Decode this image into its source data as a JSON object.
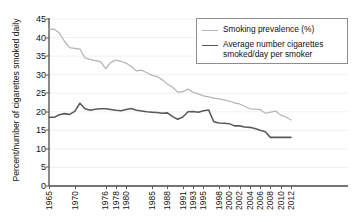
{
  "figure": {
    "cut_off_header": "",
    "background": "#ffffff"
  },
  "axes": {
    "ylabel": "Percent/number of cigarettes smoked daily",
    "xlabel": "",
    "yticks": [
      "0",
      "5",
      "10",
      "15",
      "20",
      "25",
      "30",
      "35",
      "40",
      "45"
    ],
    "xticks": [
      "1965",
      "1970",
      "1976",
      "1978",
      "1980",
      "1985",
      "1988",
      "1991",
      "1993",
      "1995",
      "1998",
      "2000",
      "2002",
      "2004",
      "2006",
      "2008",
      "2010",
      "2012"
    ]
  },
  "legend": {
    "position": "top-right",
    "items": [
      {
        "label": "Smoking prevalence (%)",
        "color": "#b5b5b5",
        "weight": "thin"
      },
      {
        "label": "Average number cigarettes\nsmoked/day per smoker",
        "color": "#5a5a5a",
        "weight": "thick"
      }
    ]
  },
  "colors": {
    "prevalence": "#b5b5b5",
    "cigarettes": "#5a5a5a",
    "axis": "#4a4a4a",
    "grid": "#f0f0f0",
    "legend_border": "#8e8e8e"
  },
  "chart_data": {
    "type": "line",
    "title": "",
    "xlabel": "",
    "ylabel": "Percent/number of cigarettes smoked daily",
    "ylim": [
      0,
      45
    ],
    "xlim": [
      1965,
      2012
    ],
    "ytick_step": 5,
    "grid": true,
    "legend_position": "top-right",
    "x": [
      1965,
      1966,
      1967,
      1968,
      1969,
      1970,
      1971,
      1972,
      1973,
      1974,
      1975,
      1976,
      1977,
      1978,
      1979,
      1980,
      1981,
      1982,
      1983,
      1984,
      1985,
      1986,
      1987,
      1988,
      1989,
      1990,
      1991,
      1992,
      1993,
      1994,
      1995,
      1996,
      1997,
      1998,
      1999,
      2000,
      2001,
      2002,
      2003,
      2004,
      2005,
      2006,
      2007,
      2008,
      2009,
      2010,
      2011,
      2012
    ],
    "series": [
      {
        "name": "Smoking prevalence (%)",
        "color": "#b5b5b5",
        "unit": "percent",
        "values": [
          42.2,
          42.3,
          41.2,
          39.0,
          37.3,
          37.1,
          36.9,
          34.5,
          34.1,
          33.8,
          33.5,
          31.6,
          33.3,
          33.9,
          33.6,
          33.1,
          32.2,
          31.0,
          31.2,
          30.5,
          29.8,
          29.5,
          28.6,
          27.5,
          26.6,
          25.3,
          25.4,
          26.1,
          25.2,
          24.8,
          24.3,
          24.0,
          23.7,
          23.5,
          23.2,
          22.9,
          22.4,
          22.1,
          21.5,
          20.8,
          20.7,
          20.6,
          19.6,
          19.9,
          20.2,
          19.1,
          18.6,
          17.8
        ]
      },
      {
        "name": "Average number cigarettes smoked/day per smoker",
        "color": "#5a5a5a",
        "unit": "cigarettes per day",
        "values": [
          18.5,
          18.5,
          19.2,
          19.5,
          19.3,
          20.1,
          22.3,
          20.8,
          20.4,
          20.7,
          20.8,
          20.8,
          20.6,
          20.4,
          20.3,
          20.6,
          20.9,
          20.4,
          20.2,
          20.0,
          19.9,
          19.8,
          19.6,
          19.7,
          18.7,
          18.0,
          18.6,
          20.0,
          20.1,
          19.9,
          20.3,
          20.5,
          17.3,
          17.0,
          16.9,
          16.8,
          16.2,
          16.2,
          15.9,
          15.8,
          15.5,
          15.0,
          14.6,
          13.1,
          13.1,
          13.1,
          13.1,
          13.1
        ]
      }
    ]
  }
}
